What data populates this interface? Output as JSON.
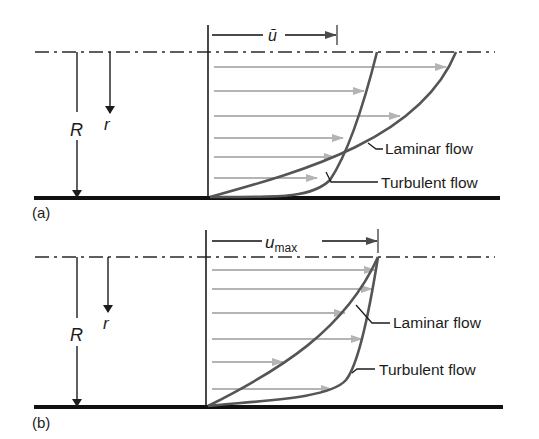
{
  "figure": {
    "colors": {
      "ink": "#1c1c1c",
      "curve": "#555555",
      "velocity_arrow": "#b4b4b4"
    },
    "panels": [
      {
        "id": "a",
        "panel_label": "(a)",
        "radius_label": "R",
        "coord_label": "r",
        "velocity_label": "ū",
        "velocity_label_sub": "",
        "curve_labels": {
          "laminar": "Laminar flow",
          "turbulent": "Turbulent flow"
        },
        "description": "Velocity profiles in pipe flow with same mean velocity ū"
      },
      {
        "id": "b",
        "panel_label": "(b)",
        "radius_label": "R",
        "coord_label": "r",
        "velocity_label": "u",
        "velocity_label_sub": "max",
        "curve_labels": {
          "laminar": "Laminar flow",
          "turbulent": "Turbulent flow"
        },
        "description": "Velocity profiles in pipe flow with same maximum velocity u_max"
      }
    ]
  }
}
